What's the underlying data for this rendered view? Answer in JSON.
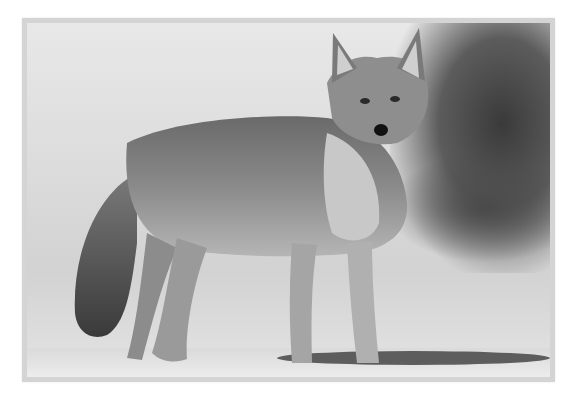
{
  "image": {
    "subject": "Coyote standing in snow, black and white photograph",
    "alt": "Black and white photo of a coyote standing in snow, looking at the camera",
    "frame_color": "#d4d4d4",
    "background_color": "#ffffff"
  }
}
